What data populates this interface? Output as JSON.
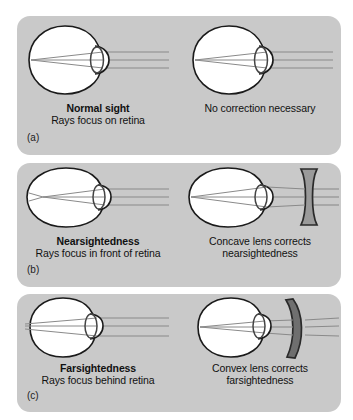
{
  "figure": {
    "background_color": "#ffffff",
    "panel_color": "#c9c9c9",
    "ray_color": "#8a8a8a",
    "outline_color": "#1a1a1a",
    "eye_fill": "#ffffff",
    "lens_fill": "#9a9a9a"
  },
  "panels": [
    {
      "letter": "(a)",
      "left": {
        "title": "Normal sight",
        "subtitle": "Rays focus on retina",
        "eye_type": "normal-eye",
        "focus": "on-retina",
        "corrective_lens": "none"
      },
      "right": {
        "text": "No correction necessary",
        "eye_type": "normal-eye",
        "focus": "on-retina",
        "corrective_lens": "none"
      }
    },
    {
      "letter": "(b)",
      "left": {
        "title": "Nearsightedness",
        "subtitle": "Rays focus in front of retina",
        "eye_type": "elongated-eye",
        "focus": "in-front-of-retina",
        "corrective_lens": "none"
      },
      "right": {
        "text_line1": "Concave lens corrects",
        "text_line2": "nearsightedness",
        "eye_type": "elongated-eye",
        "focus": "on-retina",
        "corrective_lens": "concave-lens"
      }
    },
    {
      "letter": "(c)",
      "left": {
        "title": "Farsightedness",
        "subtitle": "Rays focus behind retina",
        "eye_type": "shortened-eye",
        "focus": "behind-retina",
        "corrective_lens": "none"
      },
      "right": {
        "text_line1": "Convex lens corrects",
        "text_line2": "farsightedness",
        "eye_type": "shortened-eye",
        "focus": "on-retina",
        "corrective_lens": "convex-lens"
      }
    }
  ]
}
